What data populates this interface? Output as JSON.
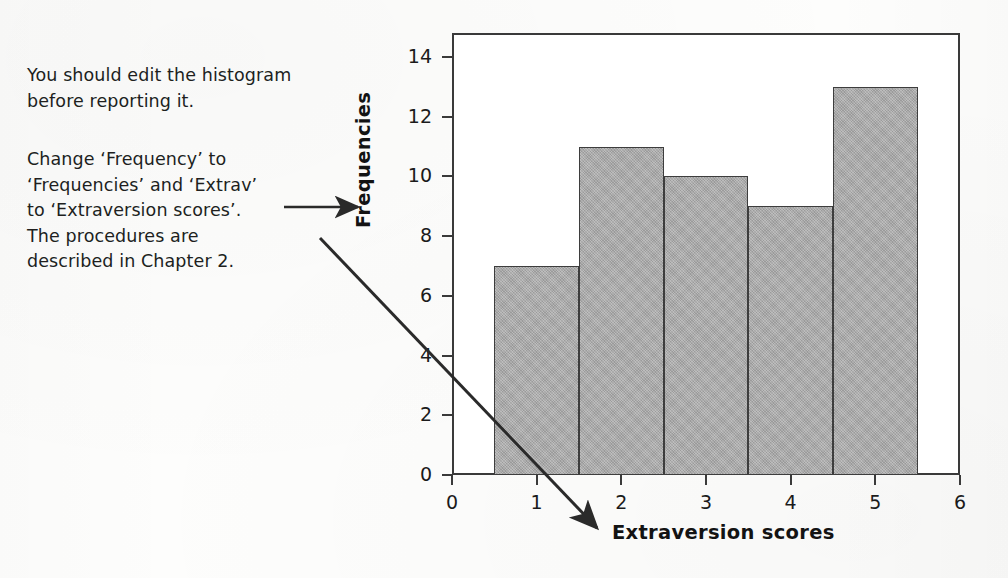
{
  "annotations": [
    {
      "name": "edit-histogram-note",
      "text": "You should edit the histogram\nbefore reporting it."
    },
    {
      "name": "relabel-note",
      "text": "Change ‘Frequency’ to\n‘Frequencies’ and ‘Extrav’\nto ‘Extraversion scores’.\nThe procedures are\ndescribed in Chapter 2."
    }
  ],
  "arrows": [
    {
      "name": "arrow-to-y-axis-label",
      "points": "284,207 360,207"
    },
    {
      "name": "arrow-to-x-axis-label",
      "points": "320,238 600,531"
    }
  ],
  "colors": {
    "bar_fill": "#a9a9a9",
    "bar_edge": "#3d3d3d",
    "frame": "#3a3a3a",
    "text": "#1b1b1b",
    "background": "#fdfdfc"
  },
  "chart_data": {
    "type": "bar",
    "title": "",
    "xlabel": "Extraversion scores",
    "ylabel": "Frequencies",
    "categories": [
      1,
      2,
      3,
      4,
      5
    ],
    "values": [
      7,
      11,
      10,
      9,
      13
    ],
    "bin_edges": [
      0.5,
      1.5,
      2.5,
      3.5,
      4.5,
      5.5
    ],
    "xlim": [
      0,
      6
    ],
    "ylim": [
      0,
      14.8
    ],
    "xticks": [
      0,
      1,
      2,
      3,
      4,
      5,
      6
    ],
    "yticks": [
      0,
      2,
      4,
      6,
      8,
      10,
      12,
      14
    ],
    "xtick_labels": [
      "0",
      "1",
      "2",
      "3",
      "4",
      "5",
      "6"
    ],
    "ytick_labels": [
      "0",
      "2",
      "4",
      "6",
      "8",
      "10",
      "12",
      "14"
    ],
    "grid": false,
    "legend": false,
    "legend_position": "none"
  }
}
